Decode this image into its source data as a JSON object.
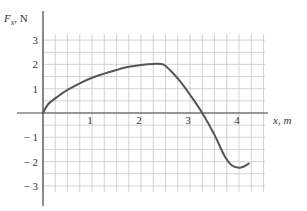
{
  "chart_data": {
    "type": "line",
    "title": "",
    "xlabel": "x, m",
    "ylabel": "F_x, N",
    "xlim": [
      0,
      4.5
    ],
    "ylim": [
      -3.25,
      3.25
    ],
    "grid": true,
    "grid_spacing": {
      "x": 0.25,
      "y": 0.5
    },
    "x_ticks": [
      1,
      2,
      3,
      4
    ],
    "x_tick_labels": [
      "1",
      "2",
      "3",
      "4"
    ],
    "y_ticks": [
      3,
      2,
      1,
      -1,
      -2,
      -3
    ],
    "y_tick_labels": [
      "3",
      "2",
      "1",
      "− 1",
      "− 2",
      "− 3"
    ],
    "legend": null,
    "series": [
      {
        "name": "F_x(x)",
        "x": [
          0,
          0.1,
          0.25,
          0.5,
          0.75,
          1.0,
          1.25,
          1.5,
          1.75,
          2.0,
          2.25,
          2.45,
          2.6,
          2.8,
          3.0,
          3.25,
          3.5,
          3.7,
          3.85,
          4.0,
          4.1,
          4.2
        ],
        "y": [
          0,
          0.35,
          0.6,
          0.95,
          1.22,
          1.45,
          1.62,
          1.77,
          1.9,
          1.98,
          2.02,
          2.0,
          1.75,
          1.3,
          0.75,
          0.0,
          -0.9,
          -1.75,
          -2.15,
          -2.25,
          -2.2,
          -2.08
        ]
      }
    ],
    "color": "#555555"
  },
  "labels": {
    "y_axis_F": "F",
    "y_axis_sub": "x",
    "y_axis_unit": ", N",
    "x_axis_title": "x, m"
  }
}
